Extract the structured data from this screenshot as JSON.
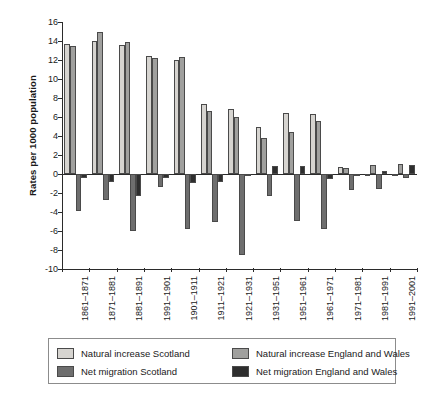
{
  "chart_data": {
    "type": "bar",
    "title": "",
    "xlabel": "",
    "ylabel": "Rates per 1000 population",
    "ylim": [
      -10,
      16
    ],
    "ytick_step": 2,
    "yticks": [
      16,
      14,
      12,
      10,
      8,
      6,
      4,
      2,
      0,
      -2,
      -4,
      -6,
      -8,
      -10
    ],
    "grid": false,
    "legend_position": "bottom",
    "categories": [
      "1861–1871",
      "1871–1881",
      "1881–1891",
      "1991–1901",
      "1901–1911",
      "1911–1921",
      "1921–1931",
      "1931–1951",
      "1951–1961",
      "1961–1971",
      "1971–1981",
      "1981–1991",
      "1991–2001"
    ],
    "series": [
      {
        "name": "Natural increase Scotland",
        "color": "#d6d4d0",
        "values": [
          13.7,
          14.0,
          13.6,
          12.4,
          12.0,
          7.4,
          6.8,
          5.0,
          6.4,
          6.3,
          0.7,
          -0.1,
          0.0
        ]
      },
      {
        "name": "Natural increase England and Wales",
        "color": "#a0a09e",
        "values": [
          13.5,
          14.9,
          13.9,
          12.2,
          12.3,
          6.6,
          6.0,
          3.8,
          4.4,
          5.6,
          0.6,
          1.0,
          1.1
        ]
      },
      {
        "name": "Net migration Scotland",
        "color": "#6e6e6e",
        "values": [
          -3.9,
          -2.7,
          -6.0,
          -1.4,
          -5.8,
          -5.1,
          -8.5,
          -2.3,
          -4.9,
          -5.8,
          -1.7,
          -1.6,
          -0.4
        ]
      },
      {
        "name": "Net migration England and Wales",
        "color": "#2e2e2e",
        "values": [
          -0.4,
          -0.8,
          -2.3,
          -0.4,
          -0.9,
          -0.8,
          -0.2,
          0.8,
          0.8,
          -0.5,
          -0.2,
          0.3,
          1.0
        ]
      }
    ]
  },
  "legend": {
    "items": [
      {
        "label": "Natural increase Scotland",
        "swatch_class": "s-ni"
      },
      {
        "label": "Natural increase England and Wales",
        "swatch_class": "e-ni"
      },
      {
        "label": "Net migration Scotland",
        "swatch_class": "s-nm"
      },
      {
        "label": "Net migration England and Wales",
        "swatch_class": "e-nm"
      }
    ]
  }
}
